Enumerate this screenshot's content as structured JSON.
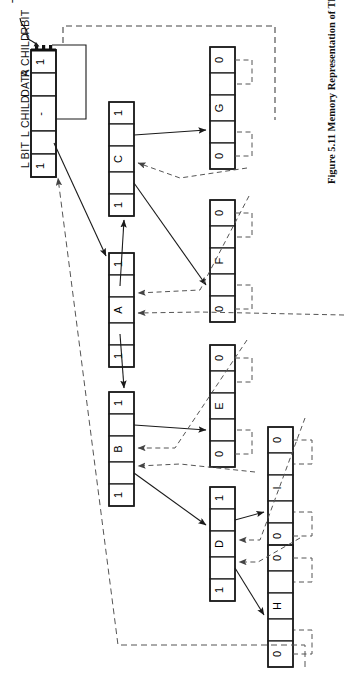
{
  "figure": {
    "number": "Figure 5.11",
    "caption": "Memory Representation of Threaded Tree",
    "full_caption": "Figure 5.11   Memory Representation of Threaded Tree"
  },
  "pointer_label": "T",
  "field_headers": [
    {
      "id": "lbit",
      "label": "L BIT"
    },
    {
      "id": "lchild",
      "label": "L CHILD"
    },
    {
      "id": "data",
      "label": "DATA"
    },
    {
      "id": "rchild",
      "label": "R CHILD"
    },
    {
      "id": "rbit",
      "label": "RBIT"
    }
  ],
  "colors": {
    "ink": "#1a1a1a",
    "paper": "#ffffff",
    "thread_line": "#555555",
    "pointer_line": "#333333"
  },
  "nodes": [
    {
      "id": "header",
      "name": "head-node",
      "data": "-",
      "lbit": "1",
      "rbit": "1",
      "lchild": "",
      "rchild": "",
      "is_header": true
    },
    {
      "id": "A",
      "name": "node-a",
      "data": "A",
      "lbit": "1",
      "rbit": "1",
      "lchild": "",
      "rchild": ""
    },
    {
      "id": "B",
      "name": "node-b",
      "data": "B",
      "lbit": "1",
      "rbit": "1",
      "lchild": "",
      "rchild": ""
    },
    {
      "id": "C",
      "name": "node-c",
      "data": "C",
      "lbit": "1",
      "rbit": "1",
      "lchild": "",
      "rchild": ""
    },
    {
      "id": "D",
      "name": "node-d",
      "data": "D",
      "lbit": "1",
      "rbit": "1",
      "lchild": "",
      "rchild": ""
    },
    {
      "id": "E",
      "name": "node-e",
      "data": "E",
      "lbit": "0",
      "rbit": "0",
      "lchild": "",
      "rchild": ""
    },
    {
      "id": "F",
      "name": "node-f",
      "data": "F",
      "lbit": "0",
      "rbit": "0",
      "lchild": "",
      "rchild": ""
    },
    {
      "id": "G",
      "name": "node-g",
      "data": "G",
      "lbit": "0",
      "rbit": "0",
      "lchild": "",
      "rchild": ""
    },
    {
      "id": "H",
      "name": "node-h",
      "data": "H",
      "lbit": "0",
      "rbit": "0",
      "lchild": "",
      "rchild": ""
    },
    {
      "id": "I",
      "name": "node-i",
      "data": "I",
      "lbit": "0",
      "rbit": "0",
      "lchild": "",
      "rchild": ""
    }
  ],
  "legend": {
    "solid_line": "pointer (child link)",
    "dashed_line": "thread (inorder predecessor/successor)"
  }
}
